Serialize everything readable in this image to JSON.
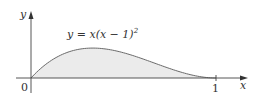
{
  "chart_data": {
    "type": "area",
    "title": "",
    "function_label": "y = x(x − 1)²",
    "function_label_parts": {
      "lhs": "y = x(x − 1)",
      "exp": "2"
    },
    "xlabel": "x",
    "ylabel": "y",
    "origin_label": "0",
    "x_ticks": [
      {
        "value": 1,
        "label": "1"
      }
    ],
    "xlim": [
      0,
      1.15
    ],
    "ylim": [
      0,
      0.3
    ],
    "x": [
      0,
      0.1,
      0.2,
      0.3333,
      0.4,
      0.5,
      0.6,
      0.7,
      0.8,
      0.9,
      1.0
    ],
    "y": [
      0,
      0.081,
      0.128,
      0.148,
      0.144,
      0.125,
      0.096,
      0.063,
      0.032,
      0.009,
      0
    ],
    "fill_color": "#ebebeb",
    "curve_color": "#6a6a6a",
    "axis_color": "#444444",
    "grid": false
  }
}
